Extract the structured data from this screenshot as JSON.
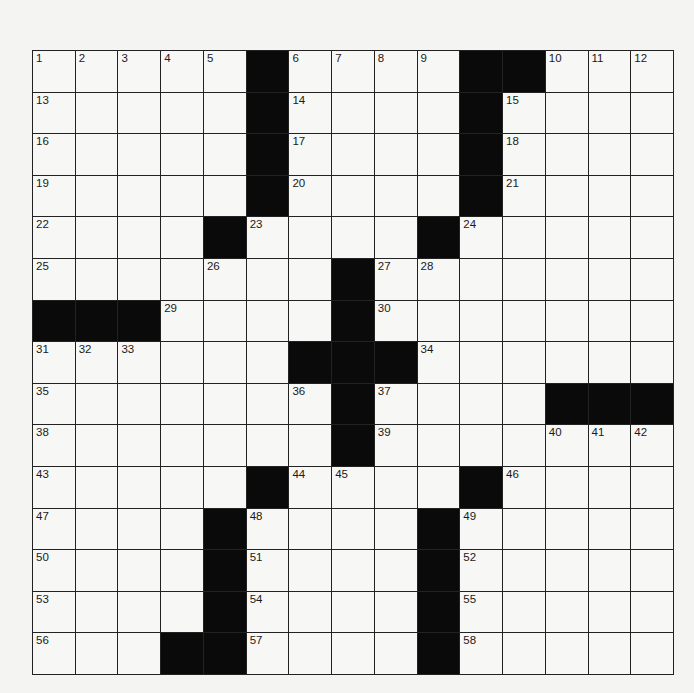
{
  "puzzle": {
    "rows": 15,
    "cols": 15,
    "layout": [
      "#####B####BB###",
      "#####B####B####",
      "#####B####B####",
      "#####B####B####",
      "####B####B#####",
      "#######B#######",
      "BBB####B#######",
      "######BBB######",
      "#######B####BBB",
      "#######B#######",
      "#####B####B####",
      "####B####B#####",
      "####B####B#####",
      "####B####B#####",
      "###BB####B#####"
    ],
    "numbers": [
      {
        "r": 0,
        "c": 0,
        "n": "1"
      },
      {
        "r": 0,
        "c": 1,
        "n": "2"
      },
      {
        "r": 0,
        "c": 2,
        "n": "3"
      },
      {
        "r": 0,
        "c": 3,
        "n": "4"
      },
      {
        "r": 0,
        "c": 4,
        "n": "5"
      },
      {
        "r": 0,
        "c": 6,
        "n": "6"
      },
      {
        "r": 0,
        "c": 7,
        "n": "7"
      },
      {
        "r": 0,
        "c": 8,
        "n": "8"
      },
      {
        "r": 0,
        "c": 9,
        "n": "9"
      },
      {
        "r": 0,
        "c": 12,
        "n": "10"
      },
      {
        "r": 0,
        "c": 13,
        "n": "11"
      },
      {
        "r": 0,
        "c": 14,
        "n": "12"
      },
      {
        "r": 1,
        "c": 0,
        "n": "13"
      },
      {
        "r": 1,
        "c": 6,
        "n": "14"
      },
      {
        "r": 1,
        "c": 11,
        "n": "15"
      },
      {
        "r": 2,
        "c": 0,
        "n": "16"
      },
      {
        "r": 2,
        "c": 6,
        "n": "17"
      },
      {
        "r": 2,
        "c": 11,
        "n": "18"
      },
      {
        "r": 3,
        "c": 0,
        "n": "19"
      },
      {
        "r": 3,
        "c": 6,
        "n": "20"
      },
      {
        "r": 3,
        "c": 11,
        "n": "21"
      },
      {
        "r": 4,
        "c": 0,
        "n": "22"
      },
      {
        "r": 4,
        "c": 5,
        "n": "23"
      },
      {
        "r": 4,
        "c": 10,
        "n": "24"
      },
      {
        "r": 5,
        "c": 0,
        "n": "25"
      },
      {
        "r": 5,
        "c": 4,
        "n": "26"
      },
      {
        "r": 5,
        "c": 8,
        "n": "27"
      },
      {
        "r": 5,
        "c": 9,
        "n": "28"
      },
      {
        "r": 6,
        "c": 3,
        "n": "29"
      },
      {
        "r": 6,
        "c": 8,
        "n": "30"
      },
      {
        "r": 7,
        "c": 0,
        "n": "31"
      },
      {
        "r": 7,
        "c": 1,
        "n": "32"
      },
      {
        "r": 7,
        "c": 2,
        "n": "33"
      },
      {
        "r": 7,
        "c": 9,
        "n": "34"
      },
      {
        "r": 8,
        "c": 0,
        "n": "35"
      },
      {
        "r": 8,
        "c": 6,
        "n": "36"
      },
      {
        "r": 8,
        "c": 8,
        "n": "37"
      },
      {
        "r": 9,
        "c": 0,
        "n": "38"
      },
      {
        "r": 9,
        "c": 8,
        "n": "39"
      },
      {
        "r": 9,
        "c": 12,
        "n": "40"
      },
      {
        "r": 9,
        "c": 13,
        "n": "41"
      },
      {
        "r": 9,
        "c": 14,
        "n": "42"
      },
      {
        "r": 10,
        "c": 0,
        "n": "43"
      },
      {
        "r": 10,
        "c": 6,
        "n": "44"
      },
      {
        "r": 10,
        "c": 7,
        "n": "45"
      },
      {
        "r": 10,
        "c": 11,
        "n": "46"
      },
      {
        "r": 11,
        "c": 0,
        "n": "47"
      },
      {
        "r": 11,
        "c": 5,
        "n": "48"
      },
      {
        "r": 11,
        "c": 10,
        "n": "49"
      },
      {
        "r": 12,
        "c": 0,
        "n": "50"
      },
      {
        "r": 12,
        "c": 5,
        "n": "51"
      },
      {
        "r": 12,
        "c": 10,
        "n": "52"
      },
      {
        "r": 13,
        "c": 0,
        "n": "53"
      },
      {
        "r": 13,
        "c": 5,
        "n": "54"
      },
      {
        "r": 13,
        "c": 10,
        "n": "55"
      },
      {
        "r": 14,
        "c": 0,
        "n": "56"
      },
      {
        "r": 14,
        "c": 5,
        "n": "57"
      },
      {
        "r": 14,
        "c": 10,
        "n": "58"
      }
    ]
  },
  "colors": {
    "paper": "#f4f4f2",
    "cell": "#f7f7f5",
    "block": "#0a0a0a",
    "line": "#222222"
  }
}
